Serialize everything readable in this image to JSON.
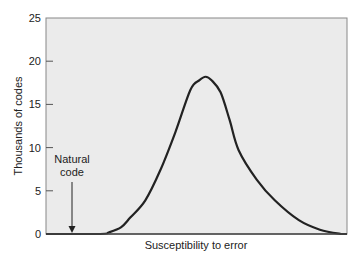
{
  "chart_data": {
    "type": "line",
    "title": "",
    "xlabel": "Susceptibility to error",
    "ylabel": "Thousands of codes",
    "ylim": [
      0,
      25
    ],
    "yticks": [
      0,
      5,
      10,
      15,
      20,
      25
    ],
    "xticks": [],
    "grid": false,
    "legend": null,
    "x": [
      0,
      18,
      21,
      25,
      28,
      33,
      38,
      43,
      48,
      51,
      53,
      55,
      58,
      61,
      64,
      70,
      76,
      84,
      91,
      98,
      100
    ],
    "series": [
      {
        "name": "Distribution of codes",
        "color": "#222222",
        "values": [
          0,
          0,
          0.2,
          0.8,
          1.9,
          3.9,
          7.4,
          11.8,
          16.7,
          17.8,
          18.2,
          17.8,
          16.4,
          13.2,
          9.7,
          6.3,
          3.9,
          1.6,
          0.5,
          0,
          0
        ]
      }
    ],
    "annotations": [
      {
        "text_lines": [
          "Natural",
          "code"
        ],
        "x": 9,
        "y_from": 6,
        "y_to": 0,
        "type": "arrow"
      }
    ]
  },
  "colors": {
    "plot_bg": "#ebebeb",
    "frame": "#777777",
    "line": "#222222"
  }
}
